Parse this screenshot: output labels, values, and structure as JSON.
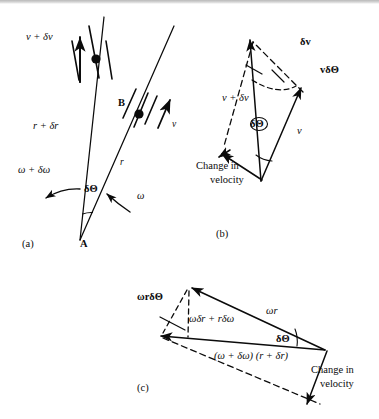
{
  "figure": {
    "background_color": "#ffffff",
    "ink_color": "#0b0b0b",
    "panels": [
      {
        "tag": "(a)",
        "name": "radius-sweep-panel",
        "labels": {
          "v_plus_dv": "v + δv",
          "r_plus_dr": "r + δr",
          "omega_plus_domega": "ω + δω",
          "delta_theta": "δΘ",
          "omega": "ω",
          "r": "r",
          "v": "v",
          "point_a": "A",
          "point_b": "B"
        }
      },
      {
        "tag": "(b)",
        "name": "velocity-triangle-panel",
        "labels": {
          "delta_v": "δv",
          "v_delta_theta": "vδΘ",
          "v_plus_dv": "v + δv",
          "v": "v",
          "delta_theta": "δΘ",
          "change_in_velocity_line1": "Change in",
          "change_in_velocity_line2": "velocity"
        }
      },
      {
        "tag": "(c)",
        "name": "angular-velocity-triangle-panel",
        "labels": {
          "omega_r_delta_theta": "ωrδΘ",
          "omega_dr_plus_r_domega": "ωδr + rδω",
          "omega_r": "ωr",
          "delta_theta": "δΘ",
          "omega_plus_domega_times_r_plus_dr": "(ω + δω) (r + δr)",
          "change_in_velocity_line1": "Change in",
          "change_in_velocity_line2": "velocity"
        }
      }
    ]
  }
}
